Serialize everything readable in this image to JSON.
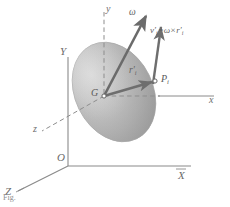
{
  "figure": {
    "kind": "3d-rigid-body-rotation-diagram",
    "background_color": "#ffffff",
    "line_color": "#7c7c7c",
    "arrow_color": "#6b6b6b",
    "body_color": "#b8b8b8",
    "label_color": "#5c5c5c"
  },
  "global_frame": {
    "x_axis_label": "X",
    "y_axis_label": "Y",
    "z_axis_label": "Z",
    "origin_label": "O"
  },
  "body_frame": {
    "x_axis_label": "x",
    "y_axis_label": "y",
    "z_axis_label": "z",
    "origin_label": "G"
  },
  "vectors": {
    "angular_velocity_label": "ω",
    "velocity_label_v": "v",
    "velocity_prime": "′",
    "velocity_sub": "i",
    "position_label_r": "r",
    "position_prime": "′",
    "position_sub": "i",
    "equation": {
      "lhs_symbol": "v",
      "lhs_prime": "′",
      "lhs_sub": "i",
      "equals": "=",
      "omega": "ω",
      "cross": "×",
      "rhs_symbol": "r",
      "rhs_prime": "′",
      "rhs_sub": "i"
    }
  },
  "points": {
    "center_of_mass_label": "G",
    "particle_label_P": "P",
    "particle_sub": "i"
  },
  "caption": {
    "text": "Fig."
  }
}
